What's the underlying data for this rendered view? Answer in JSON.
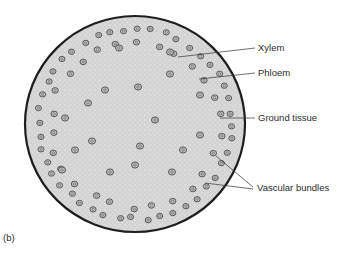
{
  "figure": {
    "panel_label": "(b)",
    "colors": {
      "ground": "#d9d9d9",
      "epidermis": "#1e1e1e",
      "bundle": "#555555",
      "leader": "#333333",
      "text": "#2b2b2b"
    },
    "labels": [
      {
        "id": "xylem",
        "text": "Xylem"
      },
      {
        "id": "phloem",
        "text": "Phloem"
      },
      {
        "id": "ground-tissue",
        "text": "Ground tissue"
      },
      {
        "id": "vascular-bundles",
        "text": "Vascular bundles"
      }
    ]
  }
}
